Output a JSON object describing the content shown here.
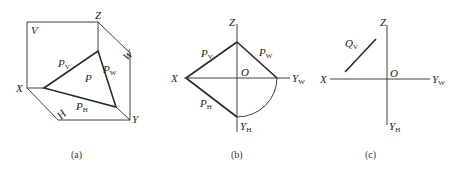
{
  "panels": {
    "a": {
      "caption": "(a)",
      "labels": {
        "Z": "Z",
        "V": "V",
        "W": "W",
        "X": "X",
        "Y": "Y",
        "H": "H",
        "P": "P",
        "PV_main": "P",
        "PV_sub": "V",
        "PW_main": "P",
        "PW_sub": "W",
        "PH_main": "P",
        "PH_sub": "H"
      }
    },
    "b": {
      "caption": "(b)",
      "labels": {
        "Z": "Z",
        "X": "X",
        "O": "O",
        "YW_main": "Y",
        "YW_sub": "W",
        "YH_main": "Y",
        "YH_sub": "H",
        "PV_main": "P",
        "PV_sub": "V",
        "PW_main": "P",
        "PW_sub": "W",
        "PH_main": "P",
        "PH_sub": "H"
      }
    },
    "c": {
      "caption": "(c)",
      "labels": {
        "Z": "Z",
        "X": "X",
        "O": "O",
        "YW_main": "Y",
        "YW_sub": "W",
        "YH_main": "Y",
        "YH_sub": "H",
        "QV_main": "Q",
        "QV_sub": "V"
      }
    }
  }
}
